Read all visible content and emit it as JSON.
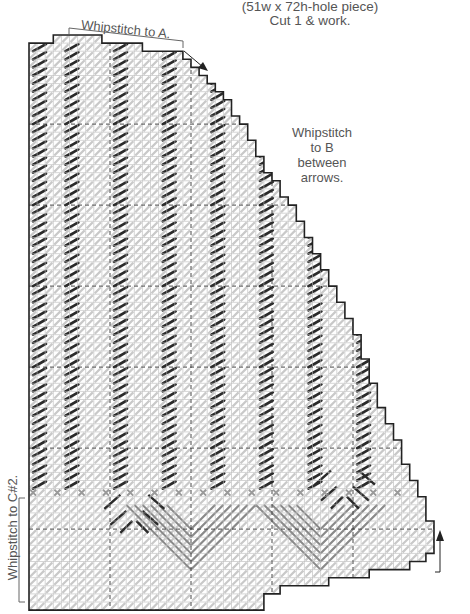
{
  "header": {
    "piece_size": "(51w x 72h-hole piece)",
    "cut_note": "Cut 1 & work."
  },
  "annotations": {
    "whipstitch_a": "Whipstitch to A.",
    "whipstitch_b": "Whipstitch to B between arrows.",
    "whipstitch_b_lines": [
      "Whipstitch",
      "to B",
      "between",
      "arrows."
    ],
    "whipstitch_c": "Whipstitch to C#2."
  },
  "grid": {
    "holes_wide": 51,
    "holes_high": 72,
    "cell_px": 8.1,
    "origin_x": 29,
    "origin_y": 35,
    "dashed_every": 10
  },
  "colors": {
    "outline": "#222222",
    "grid_line": "#b8b8b8",
    "light_stitch": "#c9c9c9",
    "dark_stitch": "#2a2a2a",
    "mid_stitch": "#8a8a8a",
    "accent_cross": "#9a9a9a",
    "text": "#555555"
  },
  "icons": {
    "arrow_a": "arrow-down-right-icon",
    "arrow_b": "arrow-up-icon"
  }
}
